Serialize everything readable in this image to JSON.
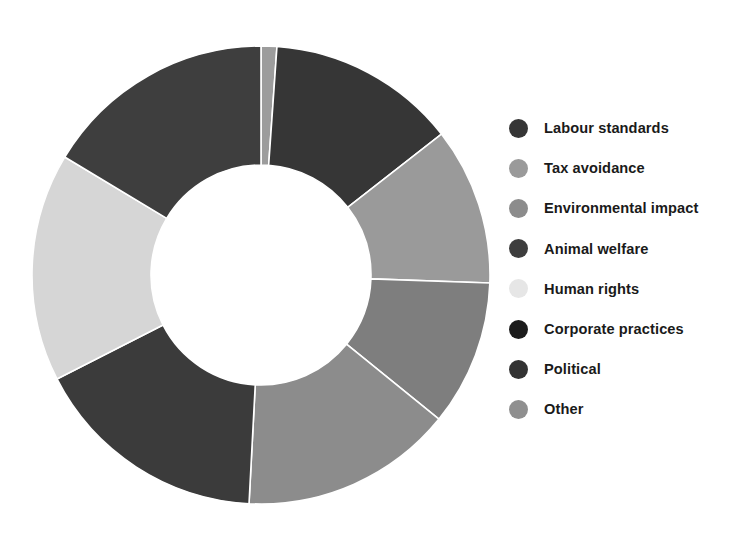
{
  "chart_data": {
    "type": "pie",
    "variant": "donut",
    "title": "",
    "subtitle": "",
    "xlabel": "",
    "ylabel": "",
    "grid": false,
    "legend_position": "right",
    "start_angle_deg": 0,
    "direction": "clockwise",
    "geometry": {
      "center_x": 261,
      "center_y": 275,
      "outer_radius": 229,
      "inner_radius": 110,
      "separator_color": "#ffffff",
      "separator_width": 1.6
    },
    "categories": [
      "Other",
      "Labour standards",
      "Tax avoidance",
      "Environmental impact",
      "Corporate practices",
      "Political",
      "Human rights",
      "Animal welfare"
    ],
    "values": [
      1.1,
      13.3,
      11.1,
      10.3,
      15.0,
      16.7,
      16.1,
      16.4
    ],
    "unit": "%",
    "slices": [
      {
        "label": "Other",
        "value": 1.1,
        "start_deg": 0.0,
        "end_deg": 4.0,
        "color": "#9c9c9c"
      },
      {
        "label": "Labour standards",
        "value": 13.3,
        "start_deg": 4.0,
        "end_deg": 52.0,
        "color": "#363636"
      },
      {
        "label": "Tax avoidance",
        "value": 11.1,
        "start_deg": 52.0,
        "end_deg": 92.0,
        "color": "#9a9a9a"
      },
      {
        "label": "Environmental impact",
        "value": 10.3,
        "start_deg": 92.0,
        "end_deg": 129.0,
        "color": "#7e7e7e"
      },
      {
        "label": "Corporate practices",
        "value": 15.0,
        "start_deg": 129.0,
        "end_deg": 183.0,
        "color": "#8c8c8c"
      },
      {
        "label": "Political",
        "value": 16.7,
        "start_deg": 183.0,
        "end_deg": 243.0,
        "color": "#3b3b3b"
      },
      {
        "label": "Human rights",
        "value": 16.1,
        "start_deg": 243.0,
        "end_deg": 301.0,
        "color": "#d6d6d6"
      },
      {
        "label": "Animal welfare",
        "value": 16.4,
        "start_deg": 301.0,
        "end_deg": 360.0,
        "color": "#3e3e3e"
      }
    ]
  },
  "legend": {
    "items": [
      {
        "label": "Labour standards",
        "color": "#363636"
      },
      {
        "label": "Tax avoidance",
        "color": "#9a9a9a"
      },
      {
        "label": "Environmental impact",
        "color": "#8c8c8c"
      },
      {
        "label": "Animal welfare",
        "color": "#3e3e3e"
      },
      {
        "label": "Human rights",
        "color": "#e6e6e6"
      },
      {
        "label": "Corporate practices",
        "color": "#1c1c1c"
      },
      {
        "label": "Political",
        "color": "#333333"
      },
      {
        "label": "Other",
        "color": "#8f8f8f"
      }
    ]
  },
  "colors": {
    "background": "#ffffff",
    "legend_text": "#1a1a1a"
  }
}
